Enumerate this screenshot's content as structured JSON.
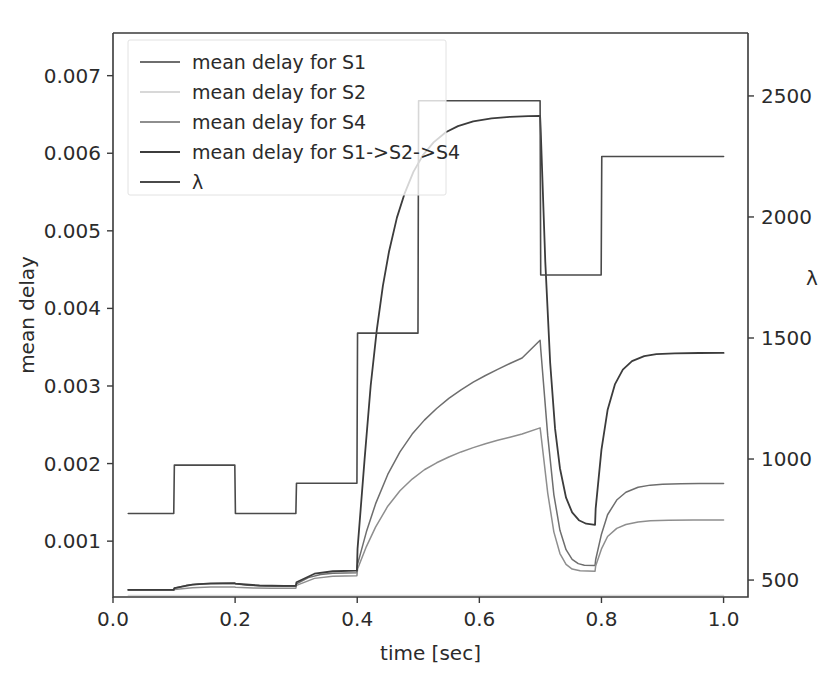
{
  "figure": {
    "width": 840,
    "height": 680,
    "background": "#ffffff",
    "plot_area": {
      "left": 113,
      "top": 33,
      "right": 748,
      "bottom": 597
    }
  },
  "chart_data": {
    "type": "line",
    "title": "",
    "xlabel": "time [sec]",
    "ylabel": "mean delay",
    "y2label": "λ",
    "xlim": [
      0.0,
      1.04
    ],
    "ylim": [
      0.00028,
      0.00755
    ],
    "y2lim": [
      430,
      2760
    ],
    "xticks": [
      0.0,
      0.2,
      0.4,
      0.6,
      0.8,
      1.0
    ],
    "xticklabels": [
      "0.0",
      "0.2",
      "0.4",
      "0.6",
      "0.8",
      "1.0"
    ],
    "yticks": [
      0.001,
      0.002,
      0.003,
      0.004,
      0.005,
      0.006,
      0.007
    ],
    "yticklabels": [
      "0.001",
      "0.002",
      "0.003",
      "0.004",
      "0.005",
      "0.006",
      "0.007"
    ],
    "y2ticks": [
      500,
      1000,
      1500,
      2000,
      2500
    ],
    "y2ticklabels": [
      "500",
      "1000",
      "1500",
      "2000",
      "2500"
    ],
    "grid": false,
    "legend_position": "upper left",
    "legend_labels": [
      "mean delay for S1",
      "mean delay for S2",
      "mean delay for S4",
      "mean delay for S1->S2->S4",
      "λ"
    ],
    "series": [
      {
        "name": "mean delay for S1",
        "axis": "left",
        "color": "#6e6e6e",
        "width": 1.5,
        "points": [
          [
            0.025,
            0.000375
          ],
          [
            0.05,
            0.000375
          ],
          [
            0.075,
            0.000375
          ],
          [
            0.0995,
            0.000375
          ],
          [
            0.1005,
            0.000392
          ],
          [
            0.12,
            0.00043
          ],
          [
            0.14,
            0.000447
          ],
          [
            0.16,
            0.000452
          ],
          [
            0.18,
            0.000454
          ],
          [
            0.1995,
            0.000455
          ],
          [
            0.2005,
            0.00045
          ],
          [
            0.22,
            0.000432
          ],
          [
            0.25,
            0.000422
          ],
          [
            0.28,
            0.00042
          ],
          [
            0.2995,
            0.00042
          ],
          [
            0.3005,
            0.00045
          ],
          [
            0.32,
            0.00053
          ],
          [
            0.34,
            0.00057
          ],
          [
            0.36,
            0.000585
          ],
          [
            0.38,
            0.00059
          ],
          [
            0.3995,
            0.000592
          ],
          [
            0.4005,
            0.0007
          ],
          [
            0.415,
            0.00112
          ],
          [
            0.43,
            0.00148
          ],
          [
            0.45,
            0.00186
          ],
          [
            0.47,
            0.00215
          ],
          [
            0.49,
            0.00238
          ],
          [
            0.51,
            0.00256
          ],
          [
            0.53,
            0.00271
          ],
          [
            0.55,
            0.00284
          ],
          [
            0.57,
            0.00295
          ],
          [
            0.59,
            0.00305
          ],
          [
            0.61,
            0.003135
          ],
          [
            0.63,
            0.003215
          ],
          [
            0.65,
            0.00329
          ],
          [
            0.67,
            0.00336
          ],
          [
            0.6995,
            0.00359
          ],
          [
            0.7005,
            0.00348
          ],
          [
            0.712,
            0.00236
          ],
          [
            0.722,
            0.0016
          ],
          [
            0.732,
            0.00114
          ],
          [
            0.742,
            0.00089
          ],
          [
            0.752,
            0.000765
          ],
          [
            0.762,
            0.00071
          ],
          [
            0.772,
            0.00069
          ],
          [
            0.7895,
            0.000685
          ],
          [
            0.7905,
            0.00076
          ],
          [
            0.8,
            0.00109
          ],
          [
            0.81,
            0.00134
          ],
          [
            0.825,
            0.00153
          ],
          [
            0.84,
            0.00163
          ],
          [
            0.86,
            0.001695
          ],
          [
            0.88,
            0.001722
          ],
          [
            0.9,
            0.001733
          ],
          [
            0.93,
            0.00174
          ],
          [
            0.96,
            0.001742
          ],
          [
            1.0,
            0.001743
          ]
        ]
      },
      {
        "name": "mean delay for S2",
        "axis": "left",
        "color": "#d8d8d8",
        "width": 1.3,
        "points": [
          [
            0.025,
            0.0003
          ],
          [
            0.2,
            0.0003
          ],
          [
            0.4,
            0.0003
          ],
          [
            0.6,
            0.0003
          ],
          [
            0.8,
            0.0003
          ],
          [
            1.0,
            0.0003
          ]
        ]
      },
      {
        "name": "mean delay for S4",
        "axis": "left",
        "color": "#8e8e8e",
        "width": 1.5,
        "points": [
          [
            0.025,
            0.000368
          ],
          [
            0.05,
            0.000368
          ],
          [
            0.075,
            0.000368
          ],
          [
            0.0995,
            0.000368
          ],
          [
            0.1005,
            0.000378
          ],
          [
            0.13,
            0.0004
          ],
          [
            0.16,
            0.000408
          ],
          [
            0.1995,
            0.00041
          ],
          [
            0.2005,
            0.000405
          ],
          [
            0.23,
            0.000396
          ],
          [
            0.26,
            0.000394
          ],
          [
            0.2995,
            0.000394
          ],
          [
            0.3005,
            0.00043
          ],
          [
            0.33,
            0.00052
          ],
          [
            0.36,
            0.000548
          ],
          [
            0.3995,
            0.000555
          ],
          [
            0.4005,
            0.00064
          ],
          [
            0.415,
            0.00093
          ],
          [
            0.43,
            0.00118
          ],
          [
            0.45,
            0.00145
          ],
          [
            0.47,
            0.00165
          ],
          [
            0.49,
            0.0018
          ],
          [
            0.51,
            0.00192
          ],
          [
            0.53,
            0.00201
          ],
          [
            0.55,
            0.002085
          ],
          [
            0.57,
            0.00215
          ],
          [
            0.59,
            0.002205
          ],
          [
            0.61,
            0.002255
          ],
          [
            0.63,
            0.0023
          ],
          [
            0.65,
            0.00234
          ],
          [
            0.67,
            0.00238
          ],
          [
            0.6995,
            0.00246
          ],
          [
            0.7005,
            0.0024
          ],
          [
            0.712,
            0.00162
          ],
          [
            0.722,
            0.00112
          ],
          [
            0.732,
            0.00084
          ],
          [
            0.742,
            0.0007
          ],
          [
            0.752,
            0.00064
          ],
          [
            0.765,
            0.000618
          ],
          [
            0.7895,
            0.000612
          ],
          [
            0.7905,
            0.00068
          ],
          [
            0.8,
            0.0009
          ],
          [
            0.81,
            0.00106
          ],
          [
            0.825,
            0.001165
          ],
          [
            0.84,
            0.001215
          ],
          [
            0.86,
            0.001248
          ],
          [
            0.88,
            0.001262
          ],
          [
            0.91,
            0.00127
          ],
          [
            0.95,
            0.001273
          ],
          [
            1.0,
            0.001274
          ]
        ]
      },
      {
        "name": "mean delay for S1->S2->S4",
        "axis": "left",
        "color": "#3c3c3c",
        "width": 1.8,
        "points": [
          [
            0.025,
            0.000372
          ],
          [
            0.06,
            0.000372
          ],
          [
            0.0995,
            0.000372
          ],
          [
            0.1005,
            0.000395
          ],
          [
            0.13,
            0.00044
          ],
          [
            0.16,
            0.000455
          ],
          [
            0.1995,
            0.000458
          ],
          [
            0.2005,
            0.000452
          ],
          [
            0.24,
            0.000428
          ],
          [
            0.28,
            0.000424
          ],
          [
            0.2995,
            0.000424
          ],
          [
            0.3005,
            0.00047
          ],
          [
            0.33,
            0.00058
          ],
          [
            0.36,
            0.000612
          ],
          [
            0.3995,
            0.00062
          ],
          [
            0.4005,
            0.0009
          ],
          [
            0.412,
            0.00205
          ],
          [
            0.422,
            0.003
          ],
          [
            0.432,
            0.00372
          ],
          [
            0.442,
            0.00429
          ],
          [
            0.452,
            0.00473
          ],
          [
            0.465,
            0.00517
          ],
          [
            0.478,
            0.00549
          ],
          [
            0.492,
            0.00576
          ],
          [
            0.508,
            0.00598
          ],
          [
            0.525,
            0.00614
          ],
          [
            0.545,
            0.00627
          ],
          [
            0.565,
            0.00635
          ],
          [
            0.59,
            0.00641
          ],
          [
            0.62,
            0.00645
          ],
          [
            0.65,
            0.00647
          ],
          [
            0.68,
            0.006478
          ],
          [
            0.6995,
            0.00648
          ],
          [
            0.7005,
            0.0063
          ],
          [
            0.708,
            0.0046
          ],
          [
            0.716,
            0.0033
          ],
          [
            0.724,
            0.00245
          ],
          [
            0.732,
            0.00194
          ],
          [
            0.742,
            0.00156
          ],
          [
            0.752,
            0.00137
          ],
          [
            0.763,
            0.00127
          ],
          [
            0.775,
            0.001225
          ],
          [
            0.7895,
            0.00121
          ],
          [
            0.7905,
            0.00142
          ],
          [
            0.8,
            0.00218
          ],
          [
            0.81,
            0.00269
          ],
          [
            0.822,
            0.00302
          ],
          [
            0.835,
            0.00321
          ],
          [
            0.85,
            0.00332
          ],
          [
            0.87,
            0.003385
          ],
          [
            0.89,
            0.00341
          ],
          [
            0.92,
            0.00342
          ],
          [
            0.96,
            0.003425
          ],
          [
            1.0,
            0.003426
          ]
        ]
      },
      {
        "name": "λ",
        "axis": "right",
        "color": "#4a4a4a",
        "width": 1.6,
        "points": [
          [
            0.025,
            775
          ],
          [
            0.0995,
            775
          ],
          [
            0.1005,
            975
          ],
          [
            0.1995,
            975
          ],
          [
            0.2005,
            775
          ],
          [
            0.2995,
            775
          ],
          [
            0.3005,
            900
          ],
          [
            0.3995,
            900
          ],
          [
            0.4005,
            1520
          ],
          [
            0.4995,
            1520
          ],
          [
            0.5005,
            2480
          ],
          [
            0.6995,
            2480
          ],
          [
            0.7005,
            1760
          ],
          [
            0.7995,
            1760
          ],
          [
            0.8005,
            2250
          ],
          [
            1.0,
            2250
          ]
        ]
      }
    ]
  },
  "legend": {
    "box": {
      "x": 128,
      "y": 40,
      "width": 318,
      "height": 155
    },
    "entries": [
      {
        "label": "mean delay for S1",
        "color": "#6e6e6e"
      },
      {
        "label": "mean delay for S2",
        "color": "#d8d8d8"
      },
      {
        "label": "mean delay for S4",
        "color": "#8e8e8e"
      },
      {
        "label": "mean delay for S1->S2->S4",
        "color": "#3c3c3c"
      },
      {
        "label": "λ",
        "color": "#4a4a4a"
      }
    ]
  }
}
